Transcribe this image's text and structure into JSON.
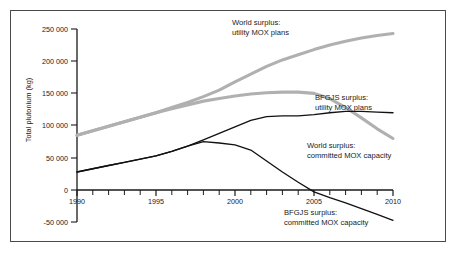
{
  "chart_data": {
    "type": "line",
    "title": "",
    "subtitle": "",
    "xlabel": "",
    "ylabel": "Total plutonium (kg)",
    "xlim": [
      1990,
      2010
    ],
    "ylim": [
      -50000,
      250000
    ],
    "grid": false,
    "legend_position": "inline-annotations",
    "x_ticks": [
      1990,
      1995,
      2000,
      2005,
      2010
    ],
    "x_tick_labels": [
      "1990",
      "1995",
      "2000",
      "2005",
      "2010"
    ],
    "x_minor_tick_interval": 1,
    "y_ticks": [
      -50000,
      0,
      50000,
      100000,
      150000,
      200000,
      250000
    ],
    "y_tick_labels": [
      "-50 000",
      "0",
      "50 000",
      "100 000",
      "150 000",
      "200 000",
      "250 000"
    ],
    "x": [
      1990,
      1991,
      1992,
      1993,
      1994,
      1995,
      1996,
      1997,
      1998,
      1999,
      2000,
      2001,
      2002,
      2003,
      2004,
      2005,
      2006,
      2007,
      2008,
      2009,
      2010
    ],
    "series": [
      {
        "name": "World surplus: utility MOX plans",
        "color": "#b0b0b0",
        "values": [
          85000,
          92000,
          99000,
          106000,
          113000,
          120000,
          128000,
          136000,
          145000,
          155000,
          168000,
          180000,
          192000,
          202000,
          210000,
          218000,
          225000,
          231000,
          236000,
          240000,
          243000
        ]
      },
      {
        "name": "BFGJS surplus: utility MOX plans",
        "color": "#b0b0b0",
        "values": [
          85000,
          92000,
          99000,
          106000,
          113000,
          120000,
          126000,
          132000,
          138000,
          142000,
          146000,
          149000,
          151000,
          152000,
          152000,
          150000,
          142000,
          128000,
          112000,
          95000,
          80000
        ]
      },
      {
        "name": "World surplus: committed MOX capacity",
        "color": "#111111",
        "values": [
          28000,
          33000,
          38000,
          43000,
          48000,
          53000,
          60000,
          68000,
          78000,
          88000,
          98000,
          108000,
          114000,
          115000,
          115000,
          117000,
          120000,
          122000,
          122000,
          121000,
          120000
        ]
      },
      {
        "name": "BFGJS surplus: committed MOX capacity",
        "color": "#111111",
        "values": [
          28000,
          33000,
          38000,
          43000,
          48000,
          53000,
          60000,
          68000,
          75000,
          73000,
          70000,
          62000,
          45000,
          28000,
          12000,
          -3000,
          -12000,
          -20000,
          -29000,
          -38000,
          -47000
        ]
      }
    ],
    "annotations": [
      {
        "id": "world-utility-mox",
        "lines": [
          "World surplus:",
          "utility MOX plans"
        ],
        "x_px": 232,
        "y_px": 25
      },
      {
        "id": "bfgjs-utility-mox",
        "lines": [
          "BFGJS surplus:",
          "utility MOX plans"
        ],
        "x_px": 315,
        "y_px": 100
      },
      {
        "id": "world-committed-mox",
        "lines": [
          "World surplus:",
          "committed MOX capacity"
        ],
        "x_px": 307,
        "y_px": 148
      },
      {
        "id": "bfgjs-committed-mox",
        "lines": [
          "BFGJS surplus:",
          "committed MOX capacity"
        ],
        "x_px": 284,
        "y_px": 215
      }
    ]
  }
}
